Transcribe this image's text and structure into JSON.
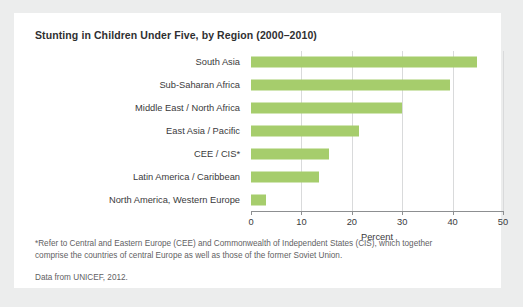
{
  "figure": {
    "title": "Stunting in Children Under Five, by Region (2000–2010)",
    "footnote": "*Refer to Central and Eastern Europe (CEE) and Commonwealth of Independent States (CIS), which together comprise the countries of central Europe as well as those of the former Soviet Union.",
    "source": "Data from UNICEF, 2012.",
    "bar_color": "#a6cd6c",
    "card_background": "#ffffff",
    "page_background": "#eceded",
    "axis_color": "#8d8f91",
    "grid_color": "#d9dadb"
  },
  "chart_data": {
    "type": "bar",
    "orientation": "horizontal",
    "title": "Stunting in Children Under Five, by Region (2000–2010)",
    "xlabel": "Percent",
    "ylabel": "",
    "xlim": [
      0,
      50
    ],
    "xticks": [
      0,
      10,
      20,
      30,
      40,
      50
    ],
    "xtick_labels": [
      "0",
      "10",
      "20",
      "30",
      "40",
      "50"
    ],
    "grid": "vertical",
    "legend": "none",
    "categories": [
      "South Asia",
      "Sub-Saharan Africa",
      "Middle East / North Africa",
      "East Asia / Pacific",
      "CEE / CIS*",
      "Latin America / Caribbean",
      "North America, Western Europe"
    ],
    "values": [
      44.8,
      39.5,
      30.0,
      21.5,
      15.5,
      13.5,
      3.0
    ],
    "series": [
      {
        "name": "Percent stunted",
        "values": [
          44.8,
          39.5,
          30.0,
          21.5,
          15.5,
          13.5,
          3.0
        ]
      }
    ]
  }
}
